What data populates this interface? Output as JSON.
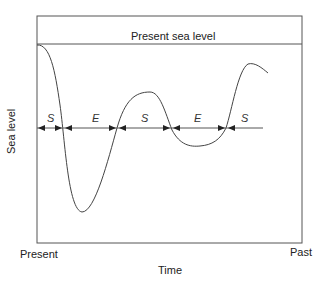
{
  "diagram": {
    "reference_line_label": "Present sea level",
    "y_axis_label": "Sea level",
    "x_axis_label": "Time",
    "x_start_label": "Present",
    "x_end_label": "Past",
    "segments": [
      {
        "label": "S"
      },
      {
        "label": "E"
      },
      {
        "label": "S"
      },
      {
        "label": "E"
      },
      {
        "label": "S"
      }
    ],
    "colors": {
      "line": "#444444",
      "frame": "#555555",
      "background": "#ffffff"
    }
  }
}
